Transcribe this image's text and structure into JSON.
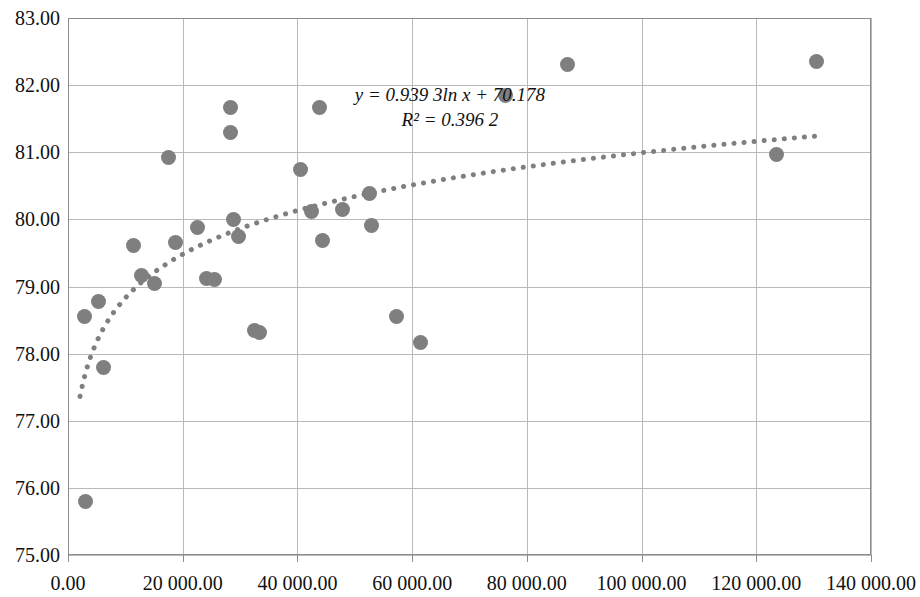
{
  "chart_data": {
    "type": "scatter",
    "title": "",
    "xlabel": "",
    "ylabel": "",
    "xlim": [
      0,
      140000
    ],
    "ylim": [
      75.0,
      83.0
    ],
    "grid": true,
    "legend": false,
    "marker_color": "#7f7f7f",
    "gridline_color": "#b9b9b9",
    "axis_color": "#8c8c8c",
    "y_ticks": [
      "75.00",
      "76.00",
      "77.00",
      "78.00",
      "79.00",
      "80.00",
      "81.00",
      "82.00",
      "83.00"
    ],
    "y_tick_values": [
      75,
      76,
      77,
      78,
      79,
      80,
      81,
      82,
      83
    ],
    "x_ticks": [
      "0.00",
      "20 000.00",
      "40 000.00",
      "60 000.00",
      "80 000.00",
      "100 000.00",
      "120 000.00",
      "140 000.00"
    ],
    "x_tick_values": [
      0,
      20000,
      40000,
      60000,
      80000,
      100000,
      120000,
      140000
    ],
    "points": [
      {
        "x": 3000,
        "y": 75.8
      },
      {
        "x": 2800,
        "y": 78.56
      },
      {
        "x": 6200,
        "y": 77.79
      },
      {
        "x": 5400,
        "y": 78.78
      },
      {
        "x": 11500,
        "y": 79.61
      },
      {
        "x": 12800,
        "y": 79.17
      },
      {
        "x": 15000,
        "y": 79.05
      },
      {
        "x": 17500,
        "y": 80.92
      },
      {
        "x": 18800,
        "y": 79.65
      },
      {
        "x": 22500,
        "y": 79.88
      },
      {
        "x": 24200,
        "y": 79.12
      },
      {
        "x": 25600,
        "y": 79.11
      },
      {
        "x": 28300,
        "y": 81.67
      },
      {
        "x": 28300,
        "y": 81.3
      },
      {
        "x": 28800,
        "y": 80.0
      },
      {
        "x": 29800,
        "y": 79.74
      },
      {
        "x": 32500,
        "y": 78.35
      },
      {
        "x": 33400,
        "y": 78.32
      },
      {
        "x": 40500,
        "y": 80.74
      },
      {
        "x": 42500,
        "y": 80.12
      },
      {
        "x": 43800,
        "y": 81.67
      },
      {
        "x": 44300,
        "y": 79.68
      },
      {
        "x": 47800,
        "y": 80.14
      },
      {
        "x": 52600,
        "y": 80.38
      },
      {
        "x": 53000,
        "y": 79.91
      },
      {
        "x": 57300,
        "y": 78.56
      },
      {
        "x": 61500,
        "y": 78.17
      },
      {
        "x": 76200,
        "y": 81.84
      },
      {
        "x": 87000,
        "y": 82.3
      },
      {
        "x": 123500,
        "y": 80.97
      },
      {
        "x": 130500,
        "y": 82.35
      }
    ],
    "trendline": {
      "type": "logarithmic",
      "equation_line1": "y = 0.939 3ln x + 70.178",
      "equation_line2": "R² = 0.396 2",
      "coefficient": 0.9393,
      "intercept": 70.178,
      "r_squared": 0.3962,
      "style": "dotted",
      "color": "#7f7f7f",
      "x_start": 2100,
      "x_end": 131000
    },
    "annotations": [
      {
        "text": "y = 0.939 3ln x + 70.178"
      },
      {
        "text": "R² = 0.396 2"
      }
    ]
  }
}
